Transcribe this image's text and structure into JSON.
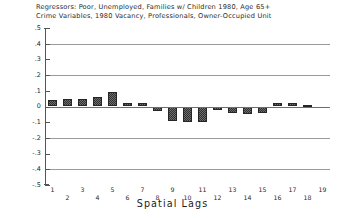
{
  "chart_data": {
    "type": "bar",
    "title": "Regressors: Poor, Unemployed, Families w/ Children 1980, Age 65+ Crime Variables, 1980 Vacancy, Professionals, Owner-Occupied Unit",
    "title_lines": [
      "Regressors: Poor, Unemployed, Families w/ Children 1980, Age 65+",
      "Crime Variables, 1980 Vacancy, Professionals, Owner-Occupied Unit"
    ],
    "xlabel": "Spatial Lags",
    "ylabel": "",
    "categories": [
      "1",
      "2",
      "3",
      "4",
      "5",
      "6",
      "7",
      "8",
      "9",
      "10",
      "11",
      "12",
      "13",
      "14",
      "15",
      "16",
      "17",
      "18",
      "19"
    ],
    "values": [
      0.04,
      0.05,
      0.05,
      0.06,
      0.09,
      0.02,
      0.025,
      -0.03,
      -0.09,
      -0.1,
      -0.1,
      -0.02,
      -0.04,
      -0.05,
      -0.04,
      0.025,
      0.02,
      0.01,
      0.0
    ],
    "ylim": [
      -0.5,
      0.5
    ],
    "yticks": [
      0.5,
      0.4,
      0.3,
      0.2,
      0.1,
      0.0,
      -0.1,
      -0.2,
      -0.3,
      -0.4,
      -0.5
    ],
    "ytick_labels": [
      ".5",
      ".4",
      ".3",
      ".2",
      ".1",
      "0",
      "-.1",
      "-.2",
      "-.3",
      "-.4",
      "-.5"
    ],
    "gridlines_at": [
      0.4,
      0.2,
      0.0,
      -0.2,
      -0.4
    ],
    "grid": true,
    "legend": "none",
    "bar_color": "#2f2f2f",
    "grid_color": "#9a9a9a",
    "axis_color": "#555555"
  }
}
